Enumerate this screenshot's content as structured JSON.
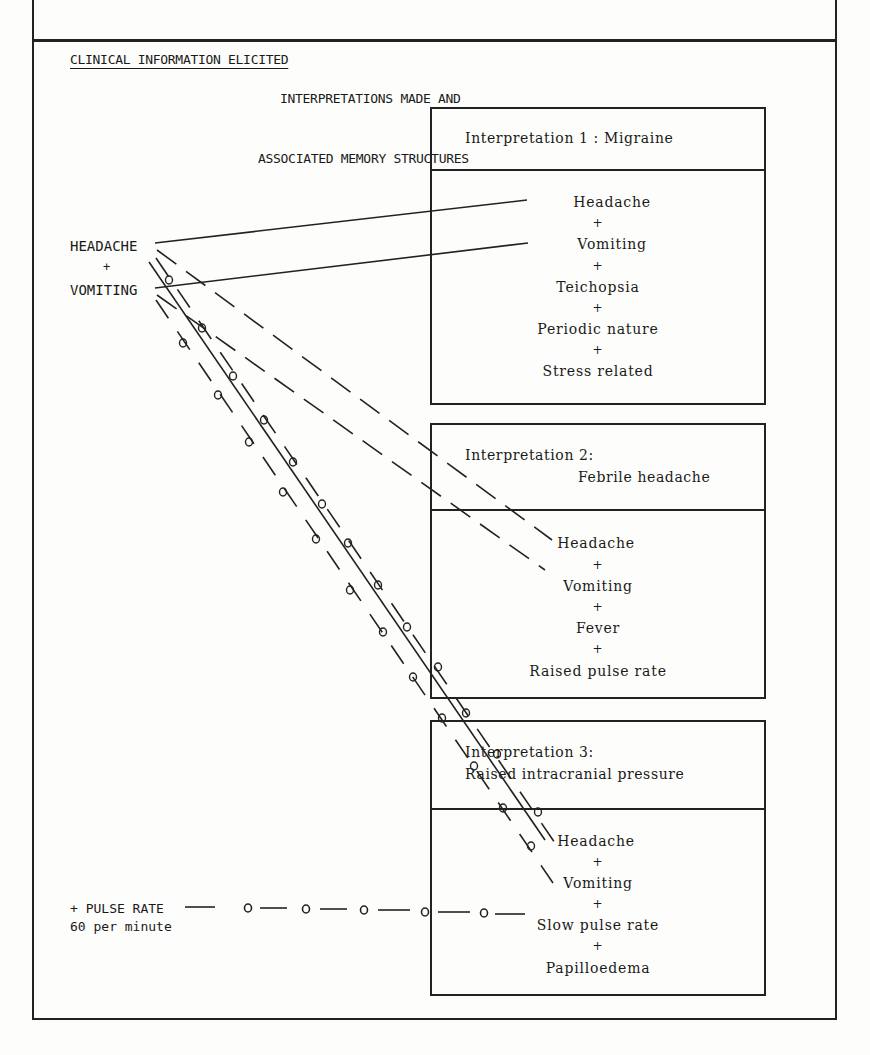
{
  "header": {
    "left_title": "CLINICAL INFORMATION ELICITED",
    "right_title_line1": "INTERPRETATIONS MADE AND",
    "right_title_line2": "ASSOCIATED MEMORY STRUCTURES"
  },
  "clinical_info": {
    "symptom1": "HEADACHE",
    "plus": "+",
    "symptom2": "VOMITING",
    "finding_line1": "+ PULSE RATE",
    "finding_line2": "60 per minute"
  },
  "interpretations": [
    {
      "title_line1": "Interpretation 1 : Migraine",
      "title_line2": "",
      "features": [
        "Headache",
        "Vomiting",
        "Teichopsia",
        "Periodic nature",
        "Stress related"
      ]
    },
    {
      "title_line1": "Interpretation 2:",
      "title_line2": "Febrile headache",
      "features": [
        "Headache",
        "Vomiting",
        "Fever",
        "Raised pulse rate"
      ]
    },
    {
      "title_line1": "Interpretation 3:",
      "title_line2": "Raised intracranial pressure",
      "features": [
        "Headache",
        "Vomiting",
        "Slow pulse rate",
        "Papilloedema"
      ]
    }
  ],
  "plus_sign": "+",
  "legend_links": {
    "solid": "link to Interpretation 1",
    "dashed": "link to Interpretation 2",
    "dashed-circled": "link to Interpretation 3"
  }
}
